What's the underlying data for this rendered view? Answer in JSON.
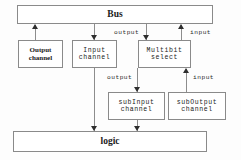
{
  "diagram": {
    "nodes": {
      "bus": {
        "label": "Bus"
      },
      "logic": {
        "label": "logic"
      },
      "output_channel": {
        "label": "Output\nchannel"
      },
      "input_channel": {
        "label": "Input\nchannel"
      },
      "multibit_select": {
        "label": "Multibit\nselect"
      },
      "subinput_channel": {
        "label": "subInput\nchannel"
      },
      "suboutput_channel": {
        "label": "subOutput\nchannel"
      }
    },
    "edge_labels": {
      "bus_output": "output",
      "bus_input": "input",
      "multibit_output": "output",
      "multibit_input": "input"
    },
    "colors": {
      "box_border": "#8a8a8a",
      "connector": "#8d8d8d",
      "arrow": "#2e2e2e",
      "text": "#1a1a1a",
      "background": "#fdfdfd"
    }
  }
}
